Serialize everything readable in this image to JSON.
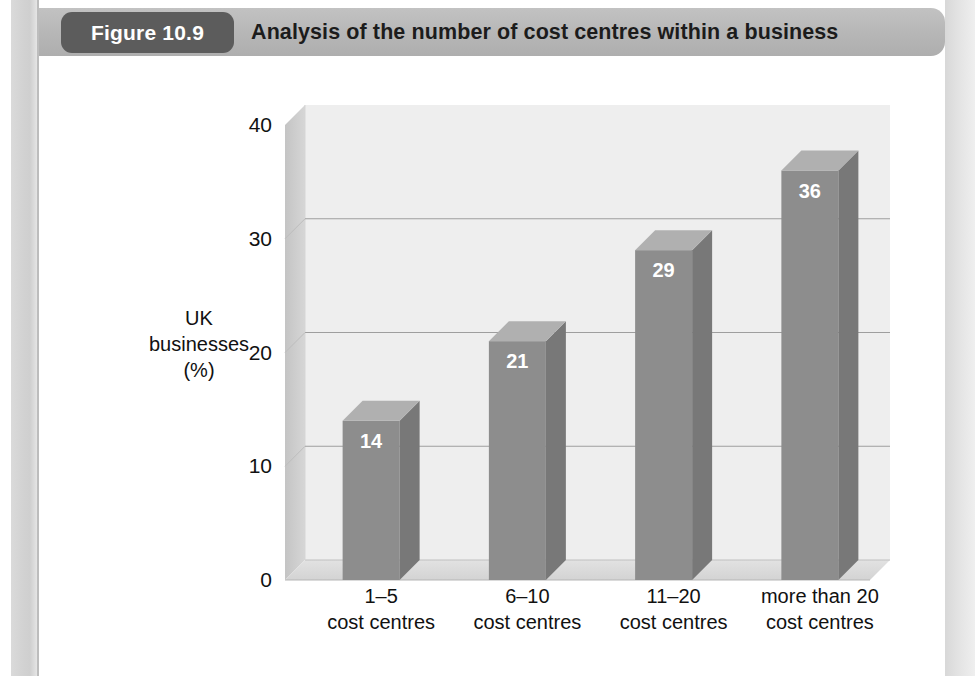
{
  "figure": {
    "badge_label": "Figure 10.9",
    "title": "Analysis of the number of cost centres within a business"
  },
  "showthrough_text": "of cost centres within a business\nin identifying cost centres\nnumber of cost centres and the size\nof the individual business\nthe responsibility of a cost centre\nsuch costs are in the overall\nbusiness the cost of\ninformation",
  "chart_data": {
    "type": "bar",
    "title": "Analysis of the number of cost centres within a business",
    "xlabel": "",
    "ylabel": "UK businesses (%)",
    "ylabel_lines": [
      "UK",
      "businesses",
      "(%)"
    ],
    "categories": [
      "1–5 cost centres",
      "6–10 cost centres",
      "11–20 cost centres",
      "more than 20 cost centres"
    ],
    "category_lines": [
      [
        "1–5",
        "cost centres"
      ],
      [
        "6–10",
        "cost centres"
      ],
      [
        "11–20",
        "cost centres"
      ],
      [
        "more than 20",
        "cost centres"
      ]
    ],
    "values": [
      14,
      21,
      29,
      36
    ],
    "value_labels": [
      "14",
      "21",
      "29",
      "36"
    ],
    "ylim": [
      0,
      40
    ],
    "yticks": [
      0,
      10,
      20,
      30,
      40
    ],
    "ytick_labels": [
      "0",
      "10",
      "20",
      "30",
      "40"
    ],
    "grid": true,
    "legend": "none",
    "style": "3d-column",
    "colors": {
      "bar_front": "#8d8d8d",
      "bar_side": "#787878",
      "bar_top": "#b0b0b0",
      "wall_back": "#eeeeee",
      "wall_side": "#c9c9c9",
      "floor": "#dcdcdc",
      "grid_line": "#9a9a9a",
      "header_band": "#b6b6b6",
      "badge": "#5c5c5c",
      "text": "#111111"
    }
  }
}
